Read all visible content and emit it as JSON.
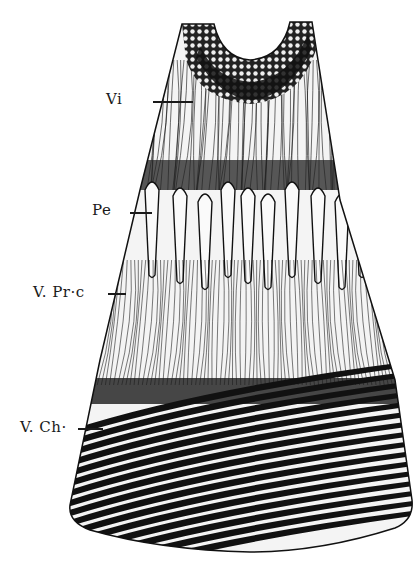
{
  "figure": {
    "ink_color": "#111111",
    "paper_color": "#ffffff",
    "regions": [
      {
        "id": "vi",
        "description": "upper cup with cellular mesh and dense fibrous band"
      },
      {
        "id": "pe",
        "description": "row of elongated club-shaped processes"
      },
      {
        "id": "vprc",
        "description": "fine vertical fibres"
      },
      {
        "id": "vch",
        "description": "bold diagonal black-and-white bands"
      }
    ]
  },
  "labels": [
    {
      "id": "vi",
      "text": "Vi"
    },
    {
      "id": "pe",
      "text": "Pe"
    },
    {
      "id": "vprc",
      "text": "V. Pr·c"
    },
    {
      "id": "vch",
      "text": "V. Ch·"
    }
  ]
}
